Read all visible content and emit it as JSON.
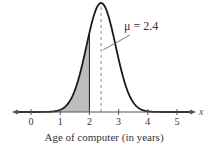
{
  "chart_data": {
    "type": "area",
    "title": "",
    "subtitle": "",
    "distribution": {
      "name": "normal",
      "mean": 2.4,
      "std_dev_estimate": 0.5
    },
    "xlabel": "Age of computer (in years)",
    "ylabel": "",
    "x_axis_variable": "x",
    "xlim": [
      -0.5,
      5.5
    ],
    "x_ticks": [
      0,
      1,
      2,
      3,
      4,
      5
    ],
    "x_tick_labels": [
      "0",
      "1",
      "2",
      "3",
      "4",
      "5"
    ],
    "grid": false,
    "legend": null,
    "shaded_region": {
      "from": "-inf",
      "to": 2
    },
    "mean_line": {
      "x": 2.4,
      "style": "dashed"
    },
    "annotations": [
      {
        "text": "μ = 2.4",
        "points_to": "mean_line"
      }
    ],
    "colors": {
      "curve": "#1a1a1a",
      "shade": "#bdbdbd",
      "axis": "#555555",
      "mean_line": "#888888"
    }
  }
}
